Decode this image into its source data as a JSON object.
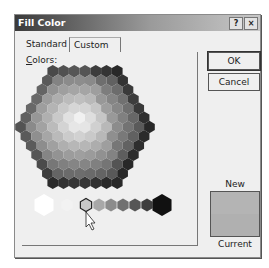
{
  "dialog": {
    "title": "Fill Color",
    "help_button": "?",
    "close_button": "×"
  },
  "tabs": [
    {
      "label": "Standard",
      "active": true
    },
    {
      "label": "Custom",
      "active": false
    }
  ],
  "colors_label": {
    "accel": "C",
    "rest": "olors:"
  },
  "buttons": {
    "ok": "OK",
    "cancel": "Cancel"
  },
  "preview": {
    "new_label": "New",
    "current_label": "Current",
    "new_color": "#b4b4b4",
    "current_color": "#b0b0b0"
  },
  "grayscale_row": {
    "selected_index": 2,
    "colors": [
      "#ffffff",
      "#f2f2f2",
      "#c8c8c8",
      "#a8a8a8",
      "#8c8c8c",
      "#707070",
      "#565656",
      "#3e3e3e",
      "#2a2a2a",
      "#111111"
    ]
  }
}
